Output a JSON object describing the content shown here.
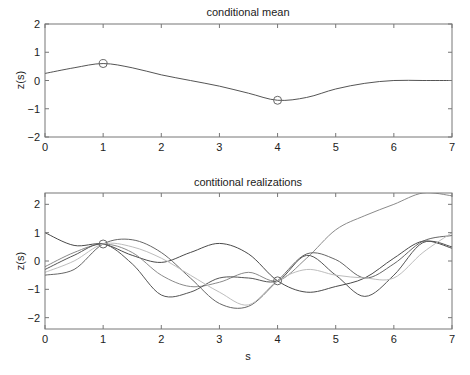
{
  "chart_data": [
    {
      "type": "line",
      "title": "conditional mean",
      "xlabel": "",
      "ylabel": "z(s)",
      "xlim": [
        0,
        7
      ],
      "ylim": [
        -2,
        2
      ],
      "xticks": [
        0,
        1,
        2,
        3,
        4,
        5,
        6,
        7
      ],
      "yticks": [
        -2,
        -1,
        0,
        1,
        2
      ],
      "grid": false,
      "legend": null,
      "x": [
        0,
        0.5,
        1,
        1.5,
        2,
        2.5,
        3,
        3.5,
        4,
        4.5,
        5,
        5.5,
        6,
        6.5,
        7
      ],
      "series": [
        {
          "name": "mean",
          "color": "#555555",
          "values": [
            0.25,
            0.45,
            0.6,
            0.45,
            0.2,
            0.0,
            -0.2,
            -0.45,
            -0.7,
            -0.6,
            -0.3,
            -0.1,
            0.0,
            0.0,
            0.0
          ]
        }
      ],
      "markers": [
        {
          "x": 1,
          "y": 0.6,
          "shape": "circle"
        },
        {
          "x": 4,
          "y": -0.7,
          "shape": "circle"
        }
      ]
    },
    {
      "type": "line",
      "title": "contitional realizations",
      "xlabel": "s",
      "ylabel": "z(s)",
      "xlim": [
        0,
        7
      ],
      "ylim": [
        -2.4,
        2.4
      ],
      "xticks": [
        0,
        1,
        2,
        3,
        4,
        5,
        6,
        7
      ],
      "yticks": [
        -2,
        -1,
        0,
        1,
        2
      ],
      "grid": false,
      "legend": null,
      "x": [
        0,
        0.5,
        1,
        1.5,
        2,
        2.5,
        3,
        3.5,
        4,
        4.5,
        5,
        5.5,
        6,
        6.5,
        7
      ],
      "series": [
        {
          "name": "realization 1",
          "color": "#4a4a4a",
          "values": [
            1.0,
            0.55,
            0.6,
            0.2,
            -0.05,
            0.3,
            0.62,
            0.25,
            -0.7,
            -1.1,
            -0.9,
            -0.6,
            0.1,
            0.7,
            0.45
          ]
        },
        {
          "name": "realization 2",
          "color": "#8a8a8a",
          "values": [
            -0.2,
            0.3,
            0.6,
            0.3,
            -0.5,
            -0.9,
            -0.75,
            -0.4,
            -0.7,
            0.1,
            1.1,
            1.6,
            2.0,
            2.4,
            2.3
          ]
        },
        {
          "name": "realization 3",
          "color": "#666666",
          "values": [
            -0.5,
            -0.3,
            0.6,
            0.75,
            0.3,
            -0.6,
            -1.5,
            -1.6,
            -0.7,
            0.25,
            0.05,
            -0.6,
            -0.1,
            0.7,
            0.9
          ]
        },
        {
          "name": "realization 4",
          "color": "#555555",
          "values": [
            -0.3,
            0.2,
            0.6,
            -0.1,
            -1.2,
            -1.1,
            -0.6,
            -0.6,
            -0.7,
            0.2,
            -0.5,
            -1.25,
            -0.5,
            0.65,
            0.5
          ]
        },
        {
          "name": "realization 5",
          "color": "#bdbdbd",
          "values": [
            -0.4,
            0.0,
            0.6,
            0.5,
            0.1,
            -0.5,
            -1.1,
            -1.55,
            -0.7,
            -0.3,
            -0.5,
            -0.6,
            -0.6,
            0.3,
            1.0
          ]
        }
      ],
      "markers": [
        {
          "x": 1,
          "y": 0.6,
          "shape": "circle"
        },
        {
          "x": 4,
          "y": -0.7,
          "shape": "circle"
        }
      ]
    }
  ]
}
